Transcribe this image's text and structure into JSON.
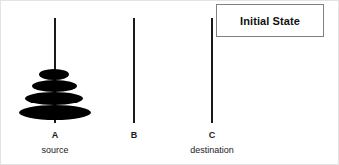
{
  "diagram": {
    "title": "Initial State",
    "background_color": "#ffffff",
    "peg_color": "#1a1a1a",
    "disk_color": "#000000",
    "box_border_color": "#808080",
    "pegs": [
      {
        "id": "A",
        "label": "A",
        "role": "source",
        "x": 53,
        "top": 17,
        "bottom": 122,
        "disk_count": 4
      },
      {
        "id": "B",
        "label": "B",
        "role": "",
        "x": 132,
        "top": 17,
        "bottom": 122,
        "disk_count": 0
      },
      {
        "id": "C",
        "label": "C",
        "role": "destination",
        "x": 210,
        "top": 17,
        "bottom": 122,
        "disk_count": 0
      }
    ],
    "disks": [
      {
        "size": 1,
        "left": 38,
        "top": 68,
        "width": 30,
        "height": 11
      },
      {
        "size": 2,
        "left": 31,
        "top": 79,
        "width": 45,
        "height": 12
      },
      {
        "size": 3,
        "left": 24,
        "top": 91,
        "width": 58,
        "height": 13
      },
      {
        "size": 4,
        "left": 18,
        "top": 104,
        "width": 72,
        "height": 15
      }
    ]
  }
}
